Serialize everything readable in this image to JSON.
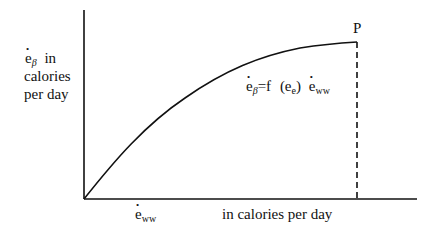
{
  "diagram": {
    "y_axis_label": {
      "symbol": "e",
      "subscript": "β",
      "line1_suffix": "in",
      "line2": "calories",
      "line3": "per day"
    },
    "x_axis_label": {
      "symbol": "e",
      "subscript": "ww",
      "unit_text": "in calories per day"
    },
    "point_label": "P",
    "equation": {
      "lhs_symbol": "e",
      "lhs_subscript": "β",
      "equals_f": "=f",
      "arg_open": "(e",
      "arg_subscript": "e",
      "arg_close": ")",
      "rhs_symbol": "e",
      "rhs_subscript": "ww"
    },
    "colors": {
      "ink": "#111111",
      "background": "#ffffff"
    }
  }
}
